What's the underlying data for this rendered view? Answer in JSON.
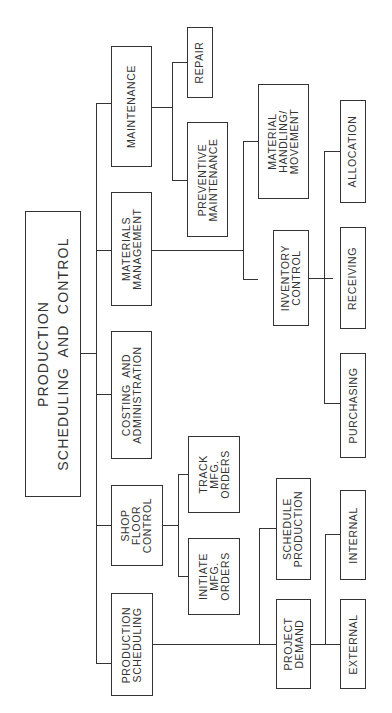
{
  "root": {
    "label": "PRODUCTION\nSCHEDULING  AND  CONTROL"
  },
  "level1": [
    {
      "label": "PRODUCTION\nSCHEDULING"
    },
    {
      "label": "SHOP\nFLOOR\nCONTROL"
    },
    {
      "label": "COSTING  AND\nADMINISTRATION"
    },
    {
      "label": "MATERIALS\nMANAGEMENT"
    },
    {
      "label": "MAINTENANCE"
    }
  ],
  "production_scheduling_children": [
    {
      "label": "PROJECT\nDEMAND"
    },
    {
      "label": "SCHEDULE\nPRODUCTION"
    }
  ],
  "project_demand_children": [
    {
      "label": "EXTERNAL"
    },
    {
      "label": "INTERNAL"
    }
  ],
  "shop_floor_children": [
    {
      "label": "INITIATE\nMFG.\nORDERS"
    },
    {
      "label": "TRACK\nMFG.\nORDERS"
    }
  ],
  "materials_children": [
    {
      "label": "INVENTORY\nCONTROL"
    },
    {
      "label": "MATERIAL\nHANDLING/\nMOVEMENT"
    }
  ],
  "inventory_children": [
    {
      "label": "PURCHASING"
    },
    {
      "label": "RECEIVING"
    },
    {
      "label": "ALLOCATION"
    }
  ],
  "maintenance_children": [
    {
      "label": "PREVENTIVE\nMAINTENANCE"
    },
    {
      "label": "REPAIR"
    }
  ]
}
